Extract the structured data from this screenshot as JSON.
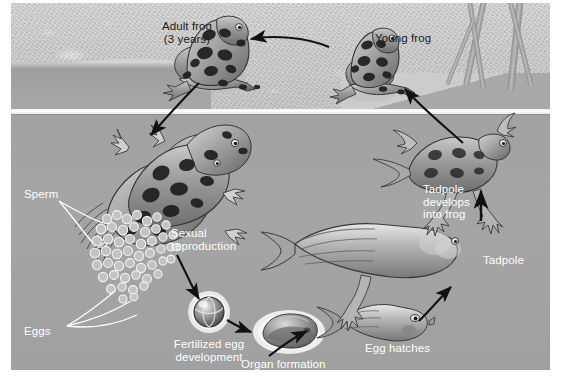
{
  "figure": {
    "type": "life-cycle-diagram",
    "subject": "frog",
    "scene": {
      "upper_zone": "land / gravel shore",
      "lower_zone": "pond water",
      "divider": "waterline"
    },
    "palette": {
      "water": "#a4a4a4",
      "land": "#cfcfcf",
      "waterline": "#ffffff",
      "label_text": "#ffffff",
      "label_text_dark": "#1c1c1c",
      "arrow": "#111111"
    }
  },
  "labels": {
    "adult_frog": "Adult frog\n(3 years)",
    "young_frog": "Young frog",
    "sperm": "Sperm",
    "eggs": "Eggs",
    "sexual_reproduction": "Sexual\nreproduction",
    "fertilized_egg": "Fertilized egg\ndevelopment",
    "organ_formation": "Organ formation",
    "egg_hatches": "Egg hatches",
    "tadpole": "Tadpole",
    "tadpole_develops": "Tadpole\ndevelops\ninto frog"
  },
  "stages": [
    {
      "id": "adult-frog",
      "label": "Adult frog (3 years)",
      "zone": "land",
      "order": 1
    },
    {
      "id": "sexual-reproduction",
      "label": "Sexual reproduction",
      "zone": "water",
      "order": 2
    },
    {
      "id": "sperm",
      "label": "Sperm",
      "zone": "water",
      "order": 2
    },
    {
      "id": "eggs",
      "label": "Eggs",
      "zone": "water",
      "order": 2
    },
    {
      "id": "fertilized-egg",
      "label": "Fertilized egg development",
      "zone": "water",
      "order": 3
    },
    {
      "id": "organ-formation",
      "label": "Organ formation",
      "zone": "water",
      "order": 4
    },
    {
      "id": "egg-hatches",
      "label": "Egg hatches",
      "zone": "water",
      "order": 5
    },
    {
      "id": "tadpole",
      "label": "Tadpole",
      "zone": "water",
      "order": 6
    },
    {
      "id": "tadpole-develops",
      "label": "Tadpole develops into frog",
      "zone": "water",
      "order": 7
    },
    {
      "id": "young-frog",
      "label": "Young frog",
      "zone": "land",
      "order": 8
    }
  ]
}
